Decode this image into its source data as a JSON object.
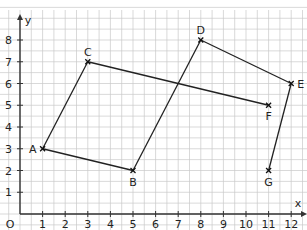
{
  "diagram": {
    "type": "coordinate-grid",
    "axes": {
      "x_label": "x",
      "y_label": "y",
      "origin_label": "O",
      "x_ticks": [
        "1",
        "2",
        "3",
        "4",
        "5",
        "6",
        "7",
        "8",
        "9",
        "10",
        "11",
        "12"
      ],
      "y_ticks": [
        "1",
        "2",
        "3",
        "4",
        "5",
        "6",
        "7",
        "8"
      ],
      "x_range": [
        0,
        12
      ],
      "y_range": [
        0,
        8
      ]
    },
    "points": [
      {
        "label": "A",
        "x": 1,
        "y": 3,
        "label_pos": "left"
      },
      {
        "label": "B",
        "x": 5,
        "y": 2,
        "label_pos": "below"
      },
      {
        "label": "C",
        "x": 3,
        "y": 7,
        "label_pos": "above"
      },
      {
        "label": "D",
        "x": 8,
        "y": 8,
        "label_pos": "above"
      },
      {
        "label": "E",
        "x": 12,
        "y": 6,
        "label_pos": "right"
      },
      {
        "label": "F",
        "x": 11,
        "y": 5,
        "label_pos": "below"
      },
      {
        "label": "G",
        "x": 11,
        "y": 2,
        "label_pos": "below"
      }
    ],
    "segments": [
      [
        "A",
        "B"
      ],
      [
        "A",
        "C"
      ],
      [
        "B",
        "D"
      ],
      [
        "C",
        "F"
      ],
      [
        "D",
        "E"
      ],
      [
        "E",
        "G"
      ]
    ],
    "intersection": {
      "x": 7,
      "y": 6
    },
    "colors": {
      "grid": "#c8c8c8",
      "axis": "#333333",
      "line": "#222222"
    }
  }
}
